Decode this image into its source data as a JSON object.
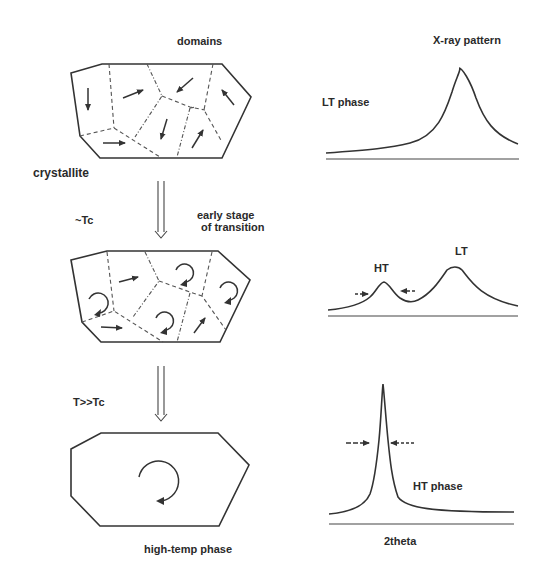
{
  "labels": {
    "domains": "domains",
    "xray_pattern": "X-ray pattern",
    "crystallite": "crystallite",
    "lt_phase": "LT phase",
    "near_tc": "~Tc",
    "early_stage_line1": "early stage",
    "early_stage_line2": "of transition",
    "ht_peak": "HT",
    "lt_peak": "LT",
    "t_much_greater_tc": "T>>Tc",
    "ht_phase": "HT phase",
    "high_temp_phase": "high-temp phase",
    "two_theta": "2theta"
  },
  "stages": [
    {
      "name": "low-temp",
      "domain_state": "ordered domains with arrows",
      "pattern": "single broad LT peak"
    },
    {
      "name": "early-transition",
      "condition": "~Tc",
      "domain_state": "mixed arrows and rotating domains",
      "pattern": "small HT peak + LT peak"
    },
    {
      "name": "high-temp",
      "condition": "T>>Tc",
      "domain_state": "single rotating crystallite",
      "pattern": "sharp HT peak"
    }
  ],
  "icons": {
    "transition_arrow": "double-line-down-arrow",
    "rotation": "circular-arrow",
    "polarization": "straight-arrow",
    "fwhm_marker": "inward-arrows"
  },
  "colors": {
    "ink": "#333333",
    "background": "#ffffff"
  }
}
